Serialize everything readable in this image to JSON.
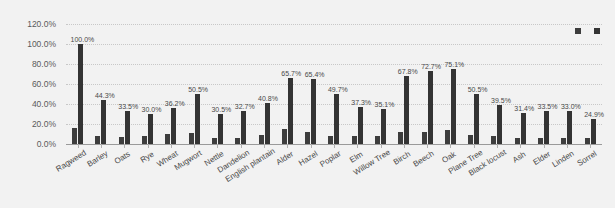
{
  "legend": {
    "position": "top-right",
    "entries": [
      {
        "label": "JP",
        "color": "#3d3d3d"
      },
      {
        "label": "CP",
        "color": "#343434"
      }
    ]
  },
  "axis": {
    "y_ticks": [
      "0.0%",
      "20.0%",
      "40.0%",
      "60.0%",
      "80.0%",
      "100.0%",
      "120.0%"
    ]
  },
  "colors": {
    "background": "#f2f2f2",
    "bar_jp": "#3d3d3d",
    "bar_cp": "#343434",
    "gridline": "#c8c8c8",
    "axis_line": "#9a9a9a",
    "label_text": "#4a4a4a"
  },
  "chart_data": {
    "type": "bar",
    "title": "",
    "subtitle": "",
    "xlabel": "",
    "ylabel": "",
    "ylim": [
      0,
      120
    ],
    "ytick_step": 20,
    "ytick_suffix": "%",
    "grid": true,
    "legend_position": "top-right",
    "categories": [
      "Ragweed",
      "Barley",
      "Oats",
      "Rye",
      "Wheat",
      "Mugwort",
      "Nettle",
      "Dandelion",
      "English plantain",
      "Alder",
      "Hazel",
      "Poplar",
      "Elm",
      "Willow Tree",
      "Birch",
      "Beech",
      "Oak",
      "Plane Tree",
      "Black locust",
      "Ash",
      "Elder",
      "Linden",
      "Sorrel"
    ],
    "series": [
      {
        "name": "JP",
        "labels_shown": false,
        "values": [
          16.0,
          8.0,
          7.5,
          8.5,
          10.0,
          11.5,
          6.0,
          6.5,
          9.0,
          15.5,
          12.5,
          8.0,
          8.0,
          8.5,
          12.0,
          12.5,
          14.0,
          9.5,
          8.0,
          6.0,
          6.5,
          6.0,
          6.0
        ]
      },
      {
        "name": "CP",
        "labels_shown": true,
        "values": [
          100.0,
          44.3,
          33.5,
          30.0,
          36.2,
          50.5,
          30.5,
          32.7,
          40.8,
          65.7,
          65.4,
          49.7,
          37.3,
          35.1,
          67.8,
          72.7,
          75.1,
          50.5,
          39.5,
          31.4,
          33.5,
          33.0,
          24.9
        ],
        "data_labels": [
          "100.0%",
          "44.3%",
          "33.5%",
          "30.0%",
          "36.2%",
          "50.5%",
          "30.5%",
          "32.7%",
          "40.8%",
          "65.7%",
          "65.4%",
          "49.7%",
          "37.3%",
          "35.1%",
          "67.8%",
          "72.7%",
          "75.1%",
          "50.5%",
          "39.5%",
          "31.4%",
          "33.5%",
          "33.0%",
          "24.9%"
        ]
      }
    ]
  }
}
